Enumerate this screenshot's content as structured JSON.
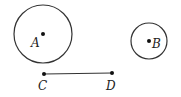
{
  "figure": {
    "width": 181,
    "height": 97,
    "stroke_color": "#333333",
    "circles": [
      {
        "name": "A",
        "cx": 43,
        "cy": 34,
        "r": 29,
        "label": "A",
        "label_x": 31,
        "label_y": 47
      },
      {
        "name": "B",
        "cx": 149,
        "cy": 41,
        "r": 18,
        "label": "B",
        "label_x": 152,
        "label_y": 48
      }
    ],
    "segment": {
      "points": [
        {
          "name": "C",
          "x": 44,
          "y": 74,
          "label": "C",
          "label_x": 38,
          "label_y": 90
        },
        {
          "name": "D",
          "x": 112,
          "y": 73,
          "label": "D",
          "label_x": 106,
          "label_y": 90
        }
      ]
    }
  }
}
